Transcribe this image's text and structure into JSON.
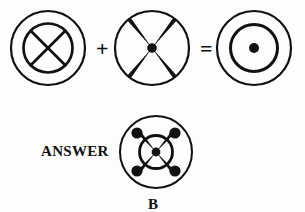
{
  "page": {
    "kind": "visual-analogy-puzzle",
    "background_color": "#fdfdfd",
    "ink_color": "#111111",
    "width": 305,
    "height": 212
  },
  "equation": {
    "operator_plus": "+",
    "operator_equals": "=",
    "terms": [
      {
        "id": "term-a",
        "name": "circle-with-crossed-inner-circle",
        "cx": 40,
        "cy": 44,
        "outer_radius": 38,
        "outer_stroke": 2.2,
        "inner_radius": 25,
        "inner_stroke": 2.6,
        "cross_type": "diagonal-x",
        "cross_stroke": 2.6,
        "center_dot_radius": 0
      },
      {
        "id": "term-b",
        "name": "circle-with-thick-tapered-x",
        "cx": 42,
        "cy": 44,
        "outer_radius": 38,
        "outer_stroke": 2.2,
        "inner_radius": 0,
        "inner_stroke": 0,
        "cross_type": "tapered-x",
        "cross_stroke": 3.4,
        "center_dot_radius": 4.6
      },
      {
        "id": "result",
        "name": "concentric-circles-with-center-dot",
        "cx": 42,
        "cy": 44,
        "outer_radius": 38,
        "outer_stroke": 2.2,
        "inner_radius": 24,
        "inner_stroke": 3.0,
        "cross_type": "none",
        "cross_stroke": 0,
        "center_dot_radius": 5.0
      }
    ]
  },
  "answer": {
    "label": "ANSWER",
    "choice_letter": "B",
    "figure": {
      "id": "answer-figure",
      "name": "circle-with-crossed-inner-circle-and-four-nodes",
      "cx": 40,
      "cy": 42,
      "outer_radius": 37,
      "outer_stroke": 2.0,
      "inner_radius": 17,
      "inner_stroke": 2.6,
      "cross_type": "tapered-x-with-nodes",
      "cross_stroke": 3.2,
      "center_dot_radius": 4.2,
      "node_radius": 5.4,
      "node_distance": 26
    }
  }
}
